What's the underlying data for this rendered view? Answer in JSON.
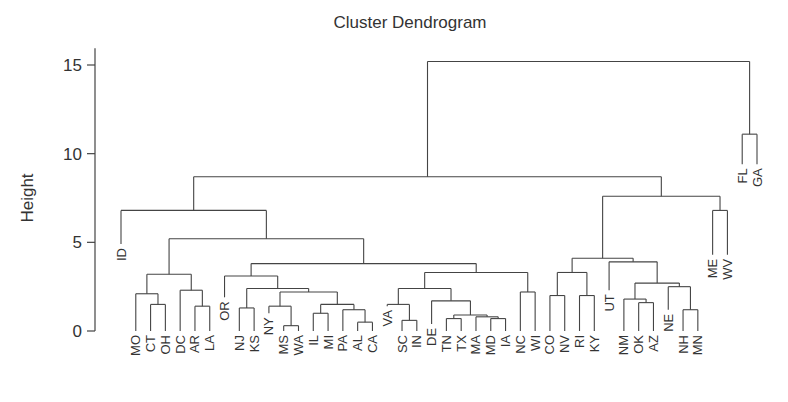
{
  "chart_data": {
    "type": "dendrogram",
    "title": "Cluster Dendrogram",
    "xlabel": "",
    "ylabel": "Height",
    "ylim": [
      0,
      16
    ],
    "yticks": [
      0,
      5,
      10,
      15
    ],
    "line_color": "#444444",
    "leaves": [
      "ID",
      "MO",
      "CT",
      "OH",
      "DC",
      "AR",
      "LA",
      "OR",
      "NJ",
      "KS",
      "NY",
      "MS",
      "WA",
      "IL",
      "MI",
      "PA",
      "AL",
      "CA",
      "VA",
      "SC",
      "IN",
      "DE",
      "TN",
      "TX",
      "MA",
      "MD",
      "IA",
      "NC",
      "WI",
      "CO",
      "NV",
      "RI",
      "KY",
      "UT",
      "NM",
      "OK",
      "AZ",
      "NE",
      "NH",
      "MN",
      "ME",
      "WV",
      "FL",
      "GA"
    ],
    "leaf_heights": {
      "ID": 4.9,
      "OR": 1.9,
      "NY": 1.0,
      "VA": 1.4,
      "DE": 0.4,
      "NE": 1.2,
      "UT": 2.3,
      "FL": 9.4,
      "GA": 9.4,
      "ME": 4.3,
      "WV": 4.3
    },
    "tree": {
      "h": 15.2,
      "c": [
        {
          "h": 8.7,
          "c": [
            {
              "h": 6.8,
              "c": [
                "ID",
                {
                  "h": 5.2,
                  "c": [
                    {
                      "h": 3.2,
                      "c": [
                        {
                          "h": 2.1,
                          "c": [
                            "MO",
                            {
                              "h": 1.5,
                              "c": [
                                "CT",
                                "OH"
                              ]
                            }
                          ]
                        },
                        {
                          "h": 2.3,
                          "c": [
                            "DC",
                            {
                              "h": 1.4,
                              "c": [
                                "AR",
                                "LA"
                              ]
                            }
                          ]
                        }
                      ]
                    },
                    {
                      "h": 3.8,
                      "c": [
                        {
                          "h": 3.1,
                          "c": [
                            "OR",
                            {
                              "h": 2.4,
                              "c": [
                                {
                                  "h": 1.3,
                                  "c": [
                                    "NJ",
                                    "KS"
                                  ]
                                },
                                {
                                  "h": 2.2,
                                  "c": [
                                    {
                                      "h": 1.4,
                                      "c": [
                                        "NY",
                                        {
                                          "h": 0.3,
                                          "c": [
                                            "MS",
                                            "WA"
                                          ]
                                        }
                                      ]
                                    },
                                    {
                                      "h": 1.5,
                                      "c": [
                                        {
                                          "h": 1.0,
                                          "c": [
                                            "IL",
                                            "MI"
                                          ]
                                        },
                                        {
                                          "h": 1.2,
                                          "c": [
                                            "PA",
                                            {
                                              "h": 0.5,
                                              "c": [
                                                "AL",
                                                "CA"
                                              ]
                                            }
                                          ]
                                        }
                                      ]
                                    }
                                  ]
                                }
                              ]
                            }
                          ]
                        },
                        {
                          "h": 3.3,
                          "c": [
                            {
                              "h": 2.4,
                              "c": [
                                {
                                  "h": 1.5,
                                  "c": [
                                    "VA",
                                    {
                                      "h": 0.6,
                                      "c": [
                                        "SC",
                                        "IN"
                                      ]
                                    }
                                  ]
                                },
                                {
                                  "h": 1.7,
                                  "c": [
                                    "DE",
                                    {
                                      "h": 0.9,
                                      "c": [
                                        {
                                          "h": 0.7,
                                          "c": [
                                            "TN",
                                            "TX"
                                          ]
                                        },
                                        {
                                          "h": 0.8,
                                          "c": [
                                            "MA",
                                            {
                                              "h": 0.7,
                                              "c": [
                                                "MD",
                                                "IA"
                                              ]
                                            }
                                          ]
                                        }
                                      ]
                                    }
                                  ]
                                }
                              ]
                            },
                            {
                              "h": 2.2,
                              "c": [
                                "NC",
                                "WI"
                              ]
                            }
                          ]
                        }
                      ]
                    }
                  ]
                }
              ]
            },
            {
              "h": 7.6,
              "c": [
                {
                  "h": 4.1,
                  "c": [
                    {
                      "h": 3.3,
                      "c": [
                        {
                          "h": 2.0,
                          "c": [
                            "CO",
                            "NV"
                          ]
                        },
                        {
                          "h": 2.0,
                          "c": [
                            "RI",
                            "KY"
                          ]
                        }
                      ]
                    },
                    {
                      "h": 3.9,
                      "c": [
                        "UT",
                        {
                          "h": 2.7,
                          "c": [
                            {
                              "h": 1.8,
                              "c": [
                                "NM",
                                {
                                  "h": 1.6,
                                  "c": [
                                    "OK",
                                    "AZ"
                                  ]
                                }
                              ]
                            },
                            {
                              "h": 2.5,
                              "c": [
                                "NE",
                                {
                                  "h": 1.2,
                                  "c": [
                                    "NH",
                                    "MN"
                                  ]
                                }
                              ]
                            }
                          ]
                        }
                      ]
                    }
                  ]
                },
                {
                  "h": 6.8,
                  "c": [
                    "ME",
                    "WV"
                  ]
                }
              ]
            }
          ]
        },
        {
          "h": 11.1,
          "c": [
            "FL",
            "GA"
          ]
        }
      ]
    }
  }
}
